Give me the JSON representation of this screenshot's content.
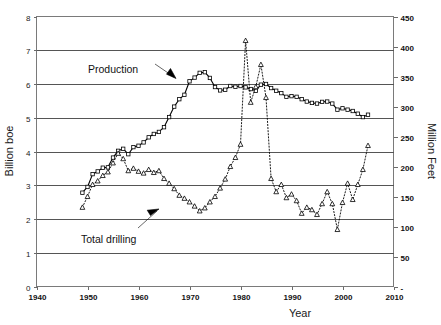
{
  "chart_data": {
    "type": "line",
    "title": "",
    "xlabel": "Year",
    "ylabel": "Billion boe",
    "y2label": "Million Feet",
    "xlim": [
      1940,
      2010
    ],
    "ylim": [
      0,
      8
    ],
    "y2lim": [
      0,
      450
    ],
    "xticks": [
      1940,
      1950,
      1960,
      1970,
      1980,
      1990,
      2000,
      2010
    ],
    "xticklabels": [
      "1940",
      "1950",
      "1960",
      "1970",
      "1980",
      "1990",
      "2000",
      "2010"
    ],
    "yticks": [
      0,
      1,
      2,
      3,
      4,
      5,
      6,
      7,
      8
    ],
    "yticklabels": [
      "0",
      "1",
      "2",
      "3",
      "4",
      "5",
      "6",
      "7",
      "8"
    ],
    "y2ticks": [
      0,
      50,
      100,
      150,
      200,
      250,
      300,
      350,
      400,
      450
    ],
    "y2ticklabels": [
      "-",
      "50",
      "100",
      "150",
      "200",
      "250",
      "300",
      "350",
      "400",
      "450"
    ],
    "grid": true,
    "grid_axis": "y",
    "legend_position": "none",
    "annotations": [
      {
        "text": "Production",
        "target_series": "Production",
        "arrow": "down-right"
      },
      {
        "text": "Total drilling",
        "target_series": "Total drilling",
        "arrow": "up-right"
      }
    ],
    "series": [
      {
        "name": "Production",
        "axis": "left",
        "units": "Billion boe",
        "marker": "square",
        "linestyle": "solid",
        "x": [
          1949,
          1950,
          1951,
          1952,
          1953,
          1954,
          1955,
          1956,
          1957,
          1958,
          1959,
          1960,
          1961,
          1962,
          1963,
          1964,
          1965,
          1966,
          1967,
          1968,
          1969,
          1970,
          1971,
          1972,
          1973,
          1974,
          1975,
          1976,
          1977,
          1978,
          1979,
          1980,
          1981,
          1982,
          1983,
          1984,
          1985,
          1986,
          1987,
          1988,
          1989,
          1990,
          1991,
          1992,
          1993,
          1994,
          1995,
          1996,
          1997,
          1998,
          1999,
          2000,
          2001,
          2002,
          2003,
          2004,
          2005
        ],
        "y": [
          2.78,
          2.95,
          3.33,
          3.41,
          3.52,
          3.53,
          3.82,
          4.02,
          4.08,
          3.92,
          4.13,
          4.17,
          4.27,
          4.42,
          4.52,
          4.58,
          4.72,
          5.02,
          5.33,
          5.55,
          5.68,
          6.08,
          6.19,
          6.33,
          6.35,
          6.18,
          5.91,
          5.81,
          5.83,
          5.94,
          5.92,
          5.94,
          5.9,
          5.85,
          5.8,
          5.98,
          6.0,
          5.88,
          5.8,
          5.73,
          5.62,
          5.64,
          5.62,
          5.55,
          5.48,
          5.44,
          5.42,
          5.47,
          5.48,
          5.42,
          5.24,
          5.28,
          5.24,
          5.2,
          5.12,
          5.02,
          5.09
        ],
        "y_peak_value": 6.35,
        "y_peak_year": 1973
      },
      {
        "name": "Total drilling",
        "axis": "right",
        "units": "Million Feet",
        "marker": "triangle",
        "linestyle": "dotted",
        "x": [
          1949,
          1950,
          1951,
          1952,
          1953,
          1954,
          1955,
          1956,
          1957,
          1958,
          1959,
          1960,
          1961,
          1962,
          1963,
          1964,
          1965,
          1966,
          1967,
          1968,
          1969,
          1970,
          1971,
          1972,
          1973,
          1974,
          1975,
          1976,
          1977,
          1978,
          1979,
          1980,
          1981,
          1982,
          1983,
          1984,
          1985,
          1986,
          1987,
          1988,
          1989,
          1990,
          1991,
          1992,
          1993,
          1994,
          1995,
          1996,
          1997,
          1998,
          1999,
          2000,
          2001,
          2002,
          2003,
          2004,
          2005
        ],
        "y": [
          132,
          150,
          170,
          176,
          185,
          191,
          206,
          222,
          213,
          193,
          197,
          192,
          189,
          195,
          190,
          193,
          180,
          172,
          163,
          152,
          147,
          141,
          134,
          126,
          131,
          141,
          150,
          164,
          179,
          200,
          215,
          237,
          240,
          307,
          333,
          370,
          315,
          180,
          158,
          170,
          148,
          154,
          143,
          122,
          132,
          128,
          120,
          138,
          158,
          138,
          95,
          140,
          172,
          145,
          170,
          195,
          235
        ],
        "y_peak_value": 410,
        "y_peak_year": 1981,
        "y_min_value": 95,
        "y_min_year": 1999
      }
    ],
    "series_drilling_extra_points": {
      "note": "sharp 1981 spike trace",
      "x": [
        1980,
        1981,
        1982
      ],
      "y": [
        237,
        410,
        307
      ]
    }
  },
  "figure": {
    "background_color": "#ffffff",
    "frame_color": "#7a7a7a",
    "grid_color": "#555555",
    "series_color": "#000000"
  }
}
